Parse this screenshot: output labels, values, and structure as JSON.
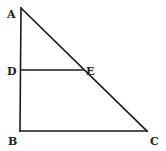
{
  "diagram": {
    "type": "geometry-triangle",
    "colors": {
      "line": "#1a1a1a",
      "label": "#222222",
      "background": "#ffffff"
    },
    "points": {
      "A": {
        "label": "A",
        "x": 21,
        "y": 8
      },
      "B": {
        "label": "B",
        "x": 20,
        "y": 131
      },
      "C": {
        "label": "C",
        "x": 147,
        "y": 131
      },
      "D": {
        "label": "D",
        "x": 21,
        "y": 70
      },
      "E": {
        "label": "E",
        "x": 83,
        "y": 70
      }
    },
    "segments": [
      {
        "from": "A",
        "to": "B"
      },
      {
        "from": "B",
        "to": "C"
      },
      {
        "from": "A",
        "to": "C"
      },
      {
        "from": "D",
        "to": "E"
      }
    ]
  }
}
